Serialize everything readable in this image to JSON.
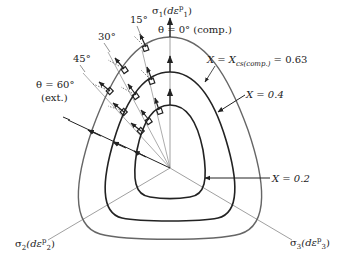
{
  "figure": {
    "axes": {
      "sigma1": {
        "sym": "σ",
        "sub": "1",
        "paren": "(dε",
        "sup": "p",
        "sub2": "1",
        "close": ")"
      },
      "sigma2": {
        "sym": "σ",
        "sub": "2",
        "paren": "(dε",
        "sup": "p",
        "sub2": "2",
        "close": ")"
      },
      "sigma3": {
        "sym": "σ",
        "sub": "3",
        "paren": "(dε",
        "sup": "p",
        "sub2": "3",
        "close": ")"
      }
    },
    "angle_labels": {
      "theta0": "θ = 0° (comp.)",
      "a15": "15°",
      "a30": "30°",
      "a45": "45°",
      "theta60_line1": "θ = 60°",
      "theta60_line2": "(ext.)"
    },
    "curve_labels": {
      "outer_prefix": "X = X",
      "outer_sub": "cs(comp.)",
      "outer_value": " = 0.63",
      "middle": "X = 0.4",
      "inner": "X = 0.2"
    },
    "curves": [
      {
        "name": "X = 0.2",
        "value": 0.2
      },
      {
        "name": "X = 0.4",
        "value": 0.4
      },
      {
        "name": "X = Xcs(comp.) = 0.63",
        "value": 0.63
      }
    ],
    "colors": {
      "bold": "#222222",
      "thin": "#777777",
      "outer": "#666666"
    }
  }
}
